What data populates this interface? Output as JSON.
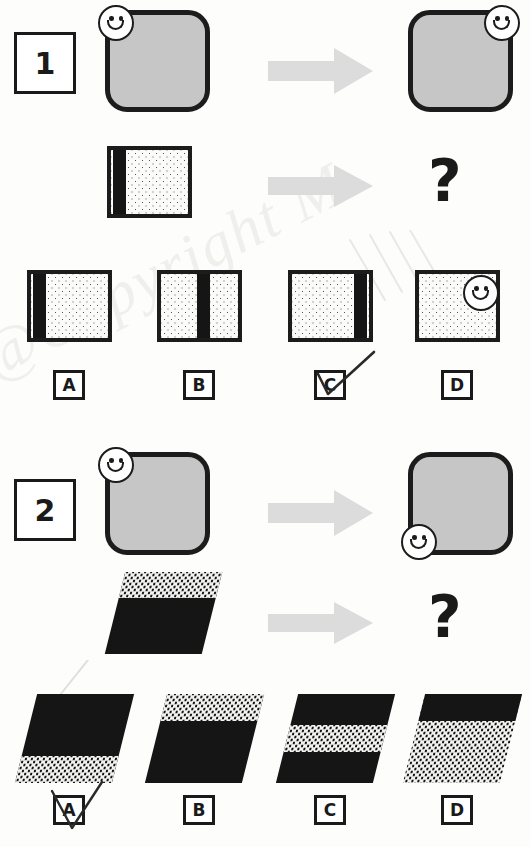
{
  "page": {
    "watermark_text": "@Copyright M"
  },
  "icons": {
    "smiley": "smiley-face-icon",
    "arrow": "right-arrow-icon",
    "question": "?",
    "tick": "tick-mark-icon"
  },
  "colors": {
    "ink": "#1a1a1a",
    "grey_fill": "#c6c6c6",
    "arrow_grey": "#dcdcdc",
    "black_fill": "#151515",
    "dot_paper": "#fbfbfa"
  },
  "questions": [
    {
      "number": "1",
      "prompt_row": {
        "left_figure": {
          "name": "rounded-square-smiley-top-left",
          "type": "rounded-square",
          "fill": "grey",
          "smiley_position": "top-left"
        },
        "arrow": "right-arrow-icon",
        "right_figure": {
          "name": "rounded-square-smiley-top-right",
          "type": "rounded-square",
          "fill": "grey",
          "smiley_position": "top-right"
        }
      },
      "question_row": {
        "left_figure": {
          "name": "dotted-square-bar-left",
          "type": "dotted-square",
          "bar_position": "left"
        },
        "arrow": "right-arrow-icon",
        "right_figure": "?"
      },
      "options": [
        {
          "letter": "A",
          "figure": "dotted-square-bar-left",
          "bar_position": "left",
          "selected": false
        },
        {
          "letter": "B",
          "figure": "dotted-square-bar-middle",
          "bar_position": "middle",
          "selected": false
        },
        {
          "letter": "C",
          "figure": "dotted-square-bar-right",
          "bar_position": "right",
          "selected": true
        },
        {
          "letter": "D",
          "figure": "dotted-square-smiley",
          "bar_position": "none",
          "selected": false
        }
      ],
      "marked_answer": "C"
    },
    {
      "number": "2",
      "prompt_row": {
        "left_figure": {
          "name": "rounded-square-smiley-top-left",
          "type": "rounded-square",
          "fill": "grey",
          "smiley_position": "top-left"
        },
        "arrow": "right-arrow-icon",
        "right_figure": {
          "name": "rounded-square-smiley-bottom-left",
          "type": "rounded-square",
          "fill": "grey",
          "smiley_position": "bottom-left"
        }
      },
      "question_row": {
        "left_figure": {
          "name": "parallelogram-band-top",
          "type": "parallelogram",
          "band_position": "top",
          "band_fill": "stippled",
          "body_fill": "black"
        },
        "arrow": "right-arrow-icon",
        "right_figure": "?"
      },
      "options": [
        {
          "letter": "A",
          "figure": "parallelogram-band-bottom",
          "band_position": "bottom",
          "selected": true
        },
        {
          "letter": "B",
          "figure": "parallelogram-band-top",
          "band_position": "top",
          "selected": false
        },
        {
          "letter": "C",
          "figure": "parallelogram-band-middle",
          "band_position": "middle",
          "selected": false
        },
        {
          "letter": "D",
          "figure": "parallelogram-inverted",
          "band_position": "inverted",
          "selected": false
        }
      ],
      "marked_answer": "A"
    }
  ]
}
